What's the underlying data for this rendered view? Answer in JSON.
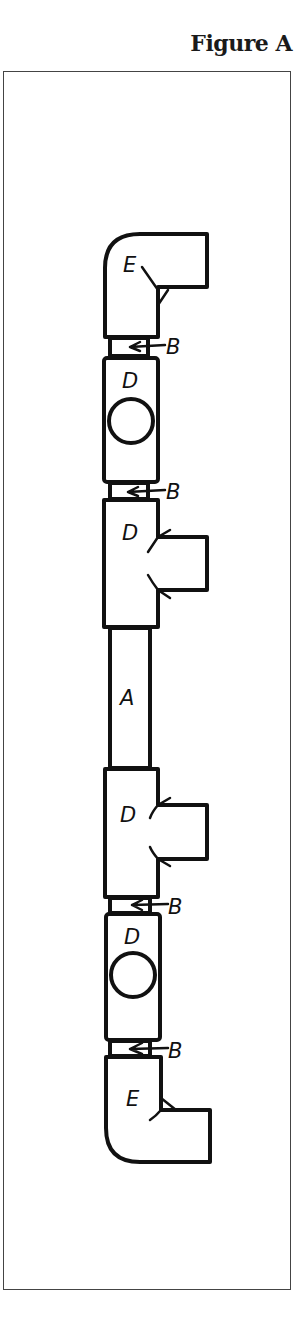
{
  "figure": {
    "title": "Figure A"
  },
  "diagram": {
    "type": "pipe-assembly",
    "orientation": "vertical",
    "parts": [
      {
        "id": "elbow-top",
        "label": "E",
        "kind": "elbow",
        "outlet": "right"
      },
      {
        "id": "coupling-1",
        "label": "B",
        "kind": "coupling-ring",
        "arrow": true
      },
      {
        "id": "valve-top",
        "label": "D",
        "kind": "fitting-with-circle"
      },
      {
        "id": "coupling-2",
        "label": "B",
        "kind": "coupling-ring",
        "arrow": true
      },
      {
        "id": "tee-top",
        "label": "D",
        "kind": "tee",
        "outlet": "right"
      },
      {
        "id": "pipe",
        "label": "A",
        "kind": "straight-pipe"
      },
      {
        "id": "tee-bottom",
        "label": "D",
        "kind": "tee",
        "outlet": "right"
      },
      {
        "id": "coupling-3",
        "label": "B",
        "kind": "coupling-ring",
        "arrow": true
      },
      {
        "id": "valve-bottom",
        "label": "D",
        "kind": "fitting-with-circle"
      },
      {
        "id": "coupling-4",
        "label": "B",
        "kind": "coupling-ring",
        "arrow": true
      },
      {
        "id": "elbow-bottom",
        "label": "E",
        "kind": "elbow",
        "outlet": "right"
      }
    ],
    "labels": {
      "elbow_top": "E",
      "coupling_1": "B",
      "valve_top": "D",
      "coupling_2": "B",
      "tee_top": "D",
      "pipe": "A",
      "tee_bottom": "D",
      "coupling_3": "B",
      "valve_bottom": "D",
      "coupling_4": "B",
      "elbow_bottom": "E"
    },
    "colors": {
      "line": "#111111",
      "background": "#ffffff",
      "frame": "#444444"
    }
  }
}
